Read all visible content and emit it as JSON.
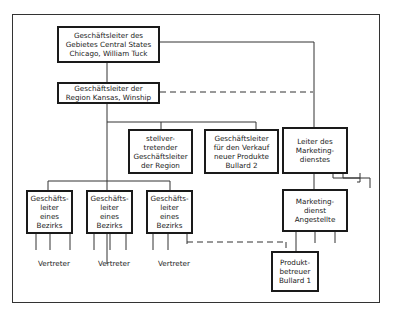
{
  "chart": {
    "nodes": {
      "gebiet": {
        "label": "Geschäftsleiter des\nGebietes Central States\nChicago, William Tuck"
      },
      "region": {
        "label": "Geschäftsleiter der\nRegion Kansas, Winship"
      },
      "stellv": {
        "label": "stellver-\ntretender\nGeschäftsleiter\nder Region"
      },
      "verkauf": {
        "label": "Geschäftsleiter\nfür den Verkauf\nneuer Produkte\nBullard 2"
      },
      "marketing": {
        "label": "Leiter des\nMarketing-\ndienstes"
      },
      "bezirk1": {
        "label": "Geschäfts-\nleiter\neines\nBezirks"
      },
      "bezirk2": {
        "label": "Geschäfts-\nleiter\neines\nBezirks"
      },
      "bezirk3": {
        "label": "Geschäfts-\nleiter\neines\nBezirks"
      },
      "angestellte": {
        "label": "Marketing-\ndienst\nAngestellte"
      },
      "produkt": {
        "label": "Produkt-\nbetreuer\nBullard 1"
      }
    },
    "labels": {
      "vertreter1": "Vertreter",
      "vertreter2": "Vertreter",
      "vertreter3": "Vertreter"
    }
  }
}
